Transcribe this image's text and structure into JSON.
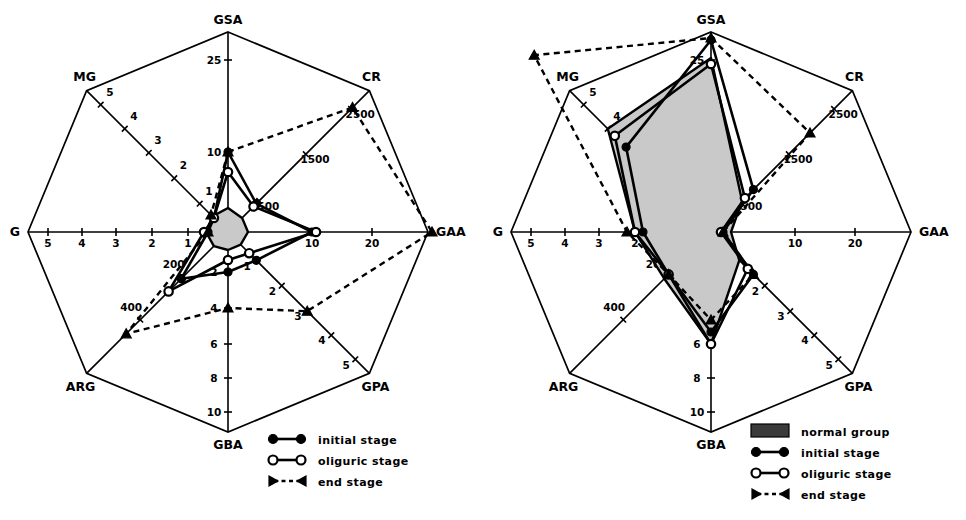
{
  "figure": {
    "title": "",
    "panels": [
      "left",
      "right"
    ]
  },
  "axes": [
    {
      "name": "GSA",
      "angle_deg": 90,
      "ticks": [
        {
          "label": "10",
          "r": 0.4
        },
        {
          "label": "25",
          "r": 0.86
        }
      ]
    },
    {
      "name": "CR",
      "angle_deg": 45,
      "ticks": [
        {
          "label": "500",
          "r": 0.22
        },
        {
          "label": "1500",
          "r": 0.55
        },
        {
          "label": "2500",
          "r": 0.87
        }
      ]
    },
    {
      "name": "GAA",
      "angle_deg": 0,
      "ticks": [
        {
          "label": "10",
          "r": 0.42
        },
        {
          "label": "20",
          "r": 0.72
        }
      ]
    },
    {
      "name": "GPA",
      "angle_deg": -45,
      "ticks": [
        {
          "label": "1",
          "r": 0.2
        },
        {
          "label": "2",
          "r": 0.38
        },
        {
          "label": "3",
          "r": 0.56
        },
        {
          "label": "4",
          "r": 0.73
        },
        {
          "label": "5",
          "r": 0.9
        }
      ]
    },
    {
      "name": "GBA",
      "angle_deg": -90,
      "ticks": [
        {
          "label": "2",
          "r": 0.2
        },
        {
          "label": "4",
          "r": 0.38
        },
        {
          "label": "6",
          "r": 0.56
        },
        {
          "label": "8",
          "r": 0.73
        },
        {
          "label": "10",
          "r": 0.9
        }
      ]
    },
    {
      "name": "ARG",
      "angle_deg": -135,
      "ticks": [
        {
          "label": "200",
          "r": 0.32
        },
        {
          "label": "400",
          "r": 0.62
        }
      ]
    },
    {
      "name": "G",
      "angle_deg": 180,
      "ticks": [
        {
          "label": "1",
          "r": 0.2
        },
        {
          "label": "2",
          "r": 0.38
        },
        {
          "label": "3",
          "r": 0.56
        },
        {
          "label": "4",
          "r": 0.73
        },
        {
          "label": "5",
          "r": 0.9
        }
      ]
    },
    {
      "name": "MG",
      "angle_deg": 135,
      "ticks": [
        {
          "label": "1",
          "r": 0.2
        },
        {
          "label": "2",
          "r": 0.38
        },
        {
          "label": "3",
          "r": 0.56
        },
        {
          "label": "4",
          "r": 0.73
        },
        {
          "label": "5",
          "r": 0.9
        }
      ]
    }
  ],
  "chart_data": [
    {
      "type": "radar",
      "panel": "left",
      "title": "",
      "categories": [
        "GSA",
        "CR",
        "GAA",
        "GPA",
        "GBA",
        "ARG",
        "G",
        "MG"
      ],
      "axis_units": {
        "GSA": "",
        "CR": "",
        "GAA": "",
        "GPA": "",
        "GBA": "",
        "ARG": "",
        "G": "",
        "MG": ""
      },
      "grid": false,
      "legend_position": "bottom-right",
      "series": [
        {
          "name": "normal group",
          "style": "filled-area",
          "marker": "none",
          "values_norm": [
            0.12,
            0.1,
            0.1,
            0.09,
            0.09,
            0.1,
            0.11,
            0.11
          ]
        },
        {
          "name": "initial stage",
          "style": "solid",
          "marker": "filled-circle",
          "values_norm": [
            0.4,
            0.2,
            0.42,
            0.2,
            0.2,
            0.33,
            0.1,
            0.1
          ]
        },
        {
          "name": "oliguric stage",
          "style": "solid",
          "marker": "open-circle",
          "values_norm": [
            0.3,
            0.18,
            0.44,
            0.15,
            0.14,
            0.42,
            0.12,
            0.1
          ]
        },
        {
          "name": "end stage",
          "style": "dashed",
          "marker": "filled-triangle",
          "values_norm": [
            0.4,
            0.88,
            1.02,
            0.56,
            0.38,
            0.72,
            0.1,
            0.12
          ]
        }
      ],
      "annotations": []
    },
    {
      "type": "radar",
      "panel": "right",
      "title": "",
      "categories": [
        "GSA",
        "CR",
        "GAA",
        "GPA",
        "GBA",
        "ARG",
        "G",
        "MG"
      ],
      "grid": false,
      "legend_position": "bottom-right",
      "series": [
        {
          "name": "normal group",
          "style": "filled-area",
          "marker": "none",
          "values_norm": [
            0.87,
            0.22,
            0.1,
            0.2,
            0.56,
            0.33,
            0.38,
            0.73
          ]
        },
        {
          "name": "initial stage",
          "style": "solid",
          "marker": "filled-circle",
          "values_norm": [
            0.96,
            0.3,
            0.06,
            0.3,
            0.5,
            0.3,
            0.34,
            0.6
          ]
        },
        {
          "name": "oliguric stage",
          "style": "solid",
          "marker": "open-circle",
          "values_norm": [
            0.84,
            0.24,
            0.05,
            0.26,
            0.56,
            0.3,
            0.38,
            0.68
          ]
        },
        {
          "name": "end stage",
          "style": "dashed",
          "marker": "filled-triangle",
          "values_norm": [
            0.97,
            0.7,
            0.06,
            0.3,
            0.44,
            0.3,
            0.42,
            1.25
          ]
        }
      ],
      "annotations": []
    }
  ],
  "legends": {
    "left": {
      "items": [
        {
          "label": "initial stage",
          "symbol": "solid-filled-circle"
        },
        {
          "label": "oliguric stage",
          "symbol": "solid-open-circle"
        },
        {
          "label": "end stage",
          "symbol": "dashed-triangle"
        }
      ]
    },
    "right": {
      "items": [
        {
          "label": "normal group",
          "symbol": "filled-swatch"
        },
        {
          "label": "initial stage",
          "symbol": "solid-filled-circle"
        },
        {
          "label": "oliguric stage",
          "symbol": "solid-open-circle"
        },
        {
          "label": "end stage",
          "symbol": "dashed-triangle"
        }
      ]
    }
  },
  "colors": {
    "ink": "#000000",
    "paper": "#ffffff",
    "shaded_area": "#c9c9c9",
    "legend_swatch": "#3a3a3a"
  }
}
